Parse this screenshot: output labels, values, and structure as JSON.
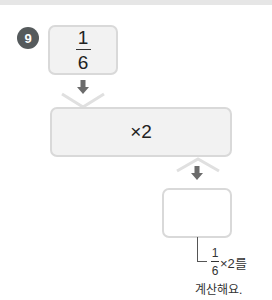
{
  "problem": {
    "number": "9",
    "start_box": {
      "numerator": "1",
      "denominator": "6"
    },
    "operation_box": {
      "label": "×2"
    },
    "result_box": {
      "value": ""
    },
    "hint": {
      "numerator": "1",
      "denominator": "6",
      "suffix": "×2를",
      "line2": "계산해요."
    }
  },
  "colors": {
    "badge": "#555a5c",
    "box_fill": "#f2f2f2",
    "box_border": "#d9d9d9",
    "arrow": "#6b6b6b",
    "chevron": "#e0e0e0"
  }
}
